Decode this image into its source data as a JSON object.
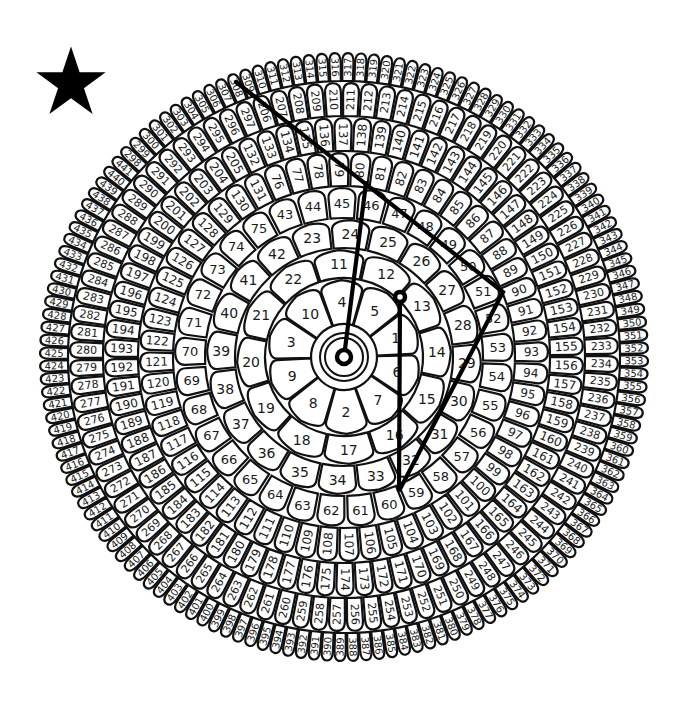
{
  "puzzle": {
    "title": "Dot-to-dot flower puzzle",
    "star_icon": "star-icon",
    "center": [
      344,
      357
    ],
    "colors": {
      "line": "#000000",
      "cell_stroke": "#111111",
      "cell_fill": "#ffffff",
      "text": "#1a1a1a",
      "background": "#ffffff"
    },
    "rings": [
      {
        "name": "ring-1",
        "start": 1,
        "end": 10,
        "r_in": 32,
        "r_out": 78,
        "start_angle": -20,
        "order": [
          4,
          5,
          1,
          6,
          7,
          2,
          8,
          9,
          3,
          10
        ],
        "font": 14
      },
      {
        "name": "ring-2",
        "start": 11,
        "end": 22,
        "r_in": 78,
        "r_out": 108,
        "start_angle": -18,
        "font": 14
      },
      {
        "name": "ring-3",
        "start": 23,
        "end": 42,
        "r_in": 108,
        "r_out": 138,
        "start_angle": -24,
        "font": 14
      },
      {
        "name": "ring-4",
        "start": 43,
        "end": 75,
        "r_in": 138,
        "r_out": 170,
        "start_angle": -28,
        "font": 13
      },
      {
        "name": "ring-5",
        "start": 76,
        "end": 131,
        "r_in": 170,
        "r_out": 205,
        "start_angle": -24,
        "font": 12
      },
      {
        "name": "ring-6",
        "start": 132,
        "end": 205,
        "r_in": 205,
        "r_out": 240,
        "start_angle": -27,
        "font": 12
      },
      {
        "name": "ring-7",
        "start": 206,
        "end": 297,
        "r_in": 240,
        "r_out": 275,
        "start_angle": -20,
        "font": 11
      },
      {
        "name": "ring-8",
        "start": 298,
        "end": 441,
        "r_in": 275,
        "r_out": 305,
        "start_angle": -48,
        "font": 10
      }
    ],
    "drawn_lines": [
      {
        "name": "line-center-to-83",
        "points": [
          [
            344,
            357
          ],
          [
            366,
            183
          ]
        ]
      },
      {
        "name": "line-306-92-106-27",
        "points": [
          [
            236,
            82
          ],
          [
            503,
            292
          ],
          [
            399,
            491
          ],
          [
            400,
            297
          ]
        ]
      }
    ],
    "markers": [
      {
        "name": "center-start-marker",
        "at": [
          344,
          357
        ],
        "r": 7
      },
      {
        "name": "dot-27-marker",
        "at": [
          400,
          297
        ],
        "r": 5
      }
    ]
  }
}
